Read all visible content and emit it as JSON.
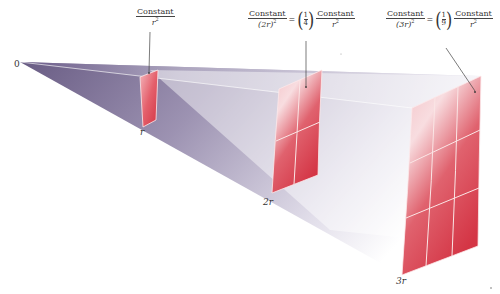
{
  "figure": {
    "origin_label": "0",
    "positions": [
      {
        "label": "r",
        "grid": "1x1"
      },
      {
        "label": "2r",
        "grid": "2x2"
      },
      {
        "label": "3r",
        "grid": "3x3"
      }
    ],
    "annotations": [
      {
        "target": "r",
        "lhs_num": "Constant",
        "lhs_den": "r",
        "lhs_den_exp": "2"
      },
      {
        "target": "2r",
        "lhs_num": "Constant",
        "lhs_den": "(2r)",
        "lhs_den_exp": "2",
        "equals": "=",
        "factor_num": "1",
        "factor_den": "4",
        "rhs_num": "Constant",
        "rhs_den": "r",
        "rhs_den_exp": "2"
      },
      {
        "target": "3r",
        "lhs_num": "Constant",
        "lhs_den": "(3r)",
        "lhs_den_exp": "2",
        "equals": "=",
        "factor_num": "1",
        "factor_den": "9",
        "rhs_num": "Constant",
        "rhs_den": "r",
        "rhs_den_exp": "2"
      }
    ],
    "colors": {
      "beam_dark": "#5a4a7a",
      "beam_light": "#e8e6ee",
      "surface_red": "#d9384a",
      "surface_light": "#f6c4c8",
      "grid_line": "#fbe6e6"
    }
  }
}
